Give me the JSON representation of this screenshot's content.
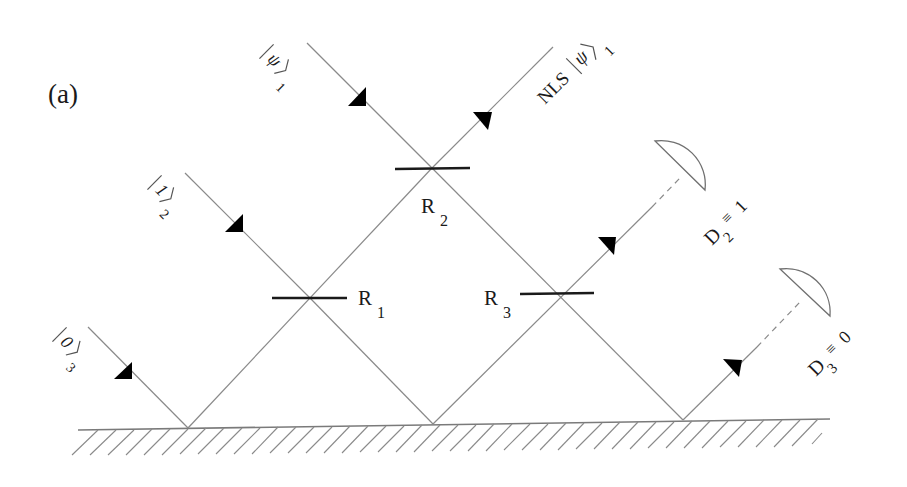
{
  "figure": {
    "panel_label": "(a)",
    "inputs": [
      {
        "id": "psi1",
        "state": "ψ",
        "subscript": "1"
      },
      {
        "id": "one2",
        "state": "1",
        "subscript": "2"
      },
      {
        "id": "zero3",
        "state": "0",
        "subscript": "3"
      }
    ],
    "output": {
      "prefix": "NLS",
      "state": "ψ",
      "subscript": "1"
    },
    "beam_splitters": [
      {
        "name": "R",
        "subscript": "1"
      },
      {
        "name": "R",
        "subscript": "2"
      },
      {
        "name": "R",
        "subscript": "3"
      }
    ],
    "detectors": [
      {
        "name": "D",
        "subscript": "2",
        "relation": "≡",
        "value": "1"
      },
      {
        "name": "D",
        "subscript": "3",
        "relation": "≡",
        "value": "0"
      }
    ],
    "colors": {
      "ray": "#8a8a8a",
      "beam_splitter": "#1a1a1a",
      "arrow": "#000000",
      "background": "#ffffff"
    }
  }
}
